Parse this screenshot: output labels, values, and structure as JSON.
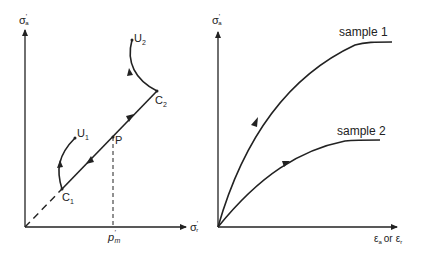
{
  "left_panel": {
    "y_axis_label": "σ'a",
    "y_axis_label_main": "σ",
    "y_axis_label_sub": "a",
    "x_axis_label_main": "σ",
    "x_axis_label_sub": "r",
    "pm_label_main": "p",
    "pm_label_sub": "m",
    "points": {
      "C1": {
        "main": "C",
        "sub": "1"
      },
      "C2": {
        "main": "C",
        "sub": "2"
      },
      "U1": {
        "main": "U",
        "sub": "1"
      },
      "U2": {
        "main": "U",
        "sub": "2"
      },
      "P": {
        "main": "P"
      }
    }
  },
  "right_panel": {
    "y_axis_label_main": "σ",
    "y_axis_label_sub": "a",
    "x_axis_label_a_main": "ε",
    "x_axis_label_a_sub": "a",
    "x_axis_or": "or",
    "x_axis_label_b_main": "ε",
    "x_axis_label_b_sub": "r",
    "series": [
      {
        "name": "sample 1"
      },
      {
        "name": "sample 2"
      }
    ]
  },
  "colors": {
    "ink": "#222222",
    "background": "#ffffff"
  }
}
